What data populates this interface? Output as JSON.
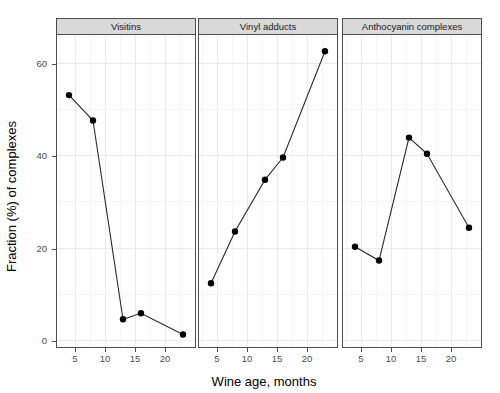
{
  "chart_data": {
    "type": "line",
    "title": "",
    "xlabel": "Wine age, months",
    "ylabel": "Fraction (%) of complexes",
    "xlim": [
      2.0,
      25.0
    ],
    "ylim": [
      -1.5,
      66.0
    ],
    "grid": true,
    "legend": "none",
    "facet_layout": "1 row x 3 columns, shared y axis",
    "y_ticks": [
      0,
      20,
      40,
      60
    ],
    "y_tick_labels": [
      "0",
      "20",
      "40",
      "60"
    ],
    "x_ticks": [
      5,
      10,
      15,
      20
    ],
    "x_tick_labels": [
      "5",
      "10",
      "15",
      "20"
    ],
    "marker": "filled-circle",
    "line_color": "#2b2b2b",
    "point_color": "#000000",
    "panels": [
      {
        "label": "Visitins",
        "x": [
          4,
          8,
          13,
          16,
          23
        ],
        "y": [
          53.0,
          47.5,
          4.5,
          5.8,
          1.2
        ]
      },
      {
        "label": "Vinyl adducts",
        "x": [
          4,
          8,
          13,
          16,
          23
        ],
        "y": [
          12.3,
          23.5,
          34.7,
          39.5,
          62.5
        ]
      },
      {
        "label": "Anthocyanin complexes",
        "x": [
          4,
          8,
          13,
          16,
          23
        ],
        "y": [
          20.2,
          17.2,
          43.8,
          40.3,
          24.3
        ]
      }
    ]
  },
  "figure": {
    "background_color": "#ffffff",
    "strip_background_color": "#d9d9d9",
    "grid_major_color": "#ebebeb",
    "grid_minor_color": "#f5f5f5",
    "axis_color": "#4d4d4d"
  }
}
